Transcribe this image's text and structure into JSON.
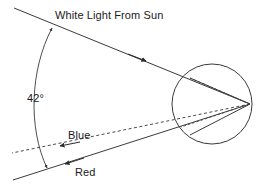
{
  "figure": {
    "title_label": "White Light From Sun",
    "angle_label": "42°",
    "blue_label": "Blue",
    "red_label": "Red"
  },
  "colors": {
    "stroke": "#3a3a3a",
    "text": "#1a1a1a",
    "background": "#ffffff",
    "dashed_stroke": "#4a4a4a"
  },
  "geometry": {
    "raindrop_circle": {
      "cx": 212,
      "cy": 104,
      "r": 40
    },
    "incoming_ray": {
      "x1": 14,
      "y1": 8,
      "x2": 250,
      "y2": 104
    },
    "incoming_arrow_at": {
      "x": 143,
      "y": 59
    },
    "red_ray": {
      "x1": 250,
      "y1": 104,
      "x2": 13,
      "y2": 180
    },
    "red_arrow_at": {
      "x": 67,
      "y": 163
    },
    "blue_ray": {
      "x1": 250,
      "y1": 104,
      "x2": 12,
      "y2": 153
    },
    "blue_arrow_at": {
      "x": 62,
      "y": 145
    },
    "angle_arc": {
      "from_x": 52,
      "from_y": 28,
      "to_x": 47,
      "to_y": 168
    },
    "entry_point": {
      "x": 190,
      "y": 78
    },
    "red_exit_point": {
      "x": 190,
      "y": 135
    },
    "blue_exit_point": {
      "x": 181,
      "y": 127
    },
    "internal_reflection_point": {
      "x": 250,
      "y": 104
    }
  }
}
